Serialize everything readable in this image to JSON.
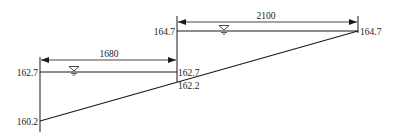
{
  "diagram": {
    "type": "canal-longitudinal-profile",
    "colors": {
      "line": "#1a1a1a",
      "background": "#ffffff"
    },
    "dimensions": {
      "left_span": "1680",
      "right_span": "2100"
    },
    "elevations": {
      "left_water": "162.7",
      "left_bed": "160.2",
      "mid_water_low": "162.7",
      "mid_bed": "162.2",
      "mid_water_high": "164.7",
      "right_water": "164.7"
    },
    "symbols": {
      "water_surface": "water-surface-triangle"
    }
  }
}
